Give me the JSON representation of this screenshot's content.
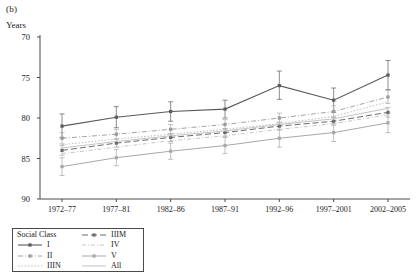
{
  "panel": {
    "label": "(b)"
  },
  "axes": {
    "y_title": "Years",
    "y_ticks": [
      "90",
      "85",
      "80",
      "75",
      "70"
    ],
    "x_ticks": [
      "1972–77",
      "1977–81",
      "1982–86",
      "1987–91",
      "1992–96",
      "1997–2001",
      "2002–2005"
    ]
  },
  "legend": {
    "title": "Social Class",
    "entries": [
      {
        "label": "I",
        "style": "solid-marker",
        "color": "#5a5a5a"
      },
      {
        "label": "II",
        "style": "dash-dot",
        "color": "#9a9a9a"
      },
      {
        "label": "IIIN",
        "style": "dotted",
        "color": "#b5b5b5"
      },
      {
        "label": "IIIM",
        "style": "dashed",
        "color": "#6b6b6b"
      },
      {
        "label": "IV",
        "style": "dash-dot-fine",
        "color": "#c0c0c0"
      },
      {
        "label": "V",
        "style": "solid-marker-light",
        "color": "#a8a8a8"
      },
      {
        "label": "All",
        "style": "solid-light",
        "color": "#bcbcbc"
      }
    ]
  },
  "chart_data": {
    "type": "line",
    "title": "",
    "xlabel": "",
    "ylabel": "Years",
    "ylim": [
      70,
      90
    ],
    "y_ticks": [
      70,
      75,
      80,
      85,
      90
    ],
    "grid": false,
    "legend_position": "below-left",
    "error_bars": true,
    "categories": [
      "1972–77",
      "1977–81",
      "1982–86",
      "1987–91",
      "1992–96",
      "1997–2001",
      "2002–2005"
    ],
    "series": [
      {
        "name": "I",
        "color": "#5a5a5a",
        "style": "solid-marker",
        "values": [
          79.0,
          80.1,
          80.8,
          81.1,
          84.0,
          82.2,
          85.3
        ],
        "err_low": [
          77.6,
          78.8,
          79.6,
          80.0,
          82.3,
          80.7,
          83.5
        ],
        "err_high": [
          80.5,
          81.4,
          82.0,
          82.2,
          85.8,
          83.7,
          87.1
        ]
      },
      {
        "name": "II",
        "color": "#9a9a9a",
        "style": "dash-dot",
        "values": [
          77.5,
          78.0,
          78.6,
          79.2,
          80.0,
          80.8,
          82.6
        ],
        "err_low": [
          76.8,
          77.4,
          78.0,
          78.6,
          79.4,
          80.1,
          81.8
        ],
        "err_high": [
          78.2,
          78.6,
          79.2,
          79.8,
          80.6,
          81.5,
          83.4
        ]
      },
      {
        "name": "IIIN",
        "color": "#b5b5b5",
        "style": "dotted",
        "values": [
          76.7,
          77.4,
          78.0,
          78.6,
          79.3,
          80.2,
          82.0
        ],
        "err_low": [
          75.9,
          76.7,
          77.3,
          77.9,
          78.6,
          79.4,
          81.1
        ],
        "err_high": [
          77.5,
          78.1,
          78.7,
          79.3,
          80.0,
          81.0,
          82.9
        ]
      },
      {
        "name": "IIIM",
        "color": "#6b6b6b",
        "style": "dashed",
        "values": [
          76.0,
          76.9,
          77.6,
          78.2,
          79.0,
          79.6,
          80.7
        ],
        "err_low": [
          75.4,
          76.4,
          77.1,
          77.7,
          78.5,
          79.1,
          80.1
        ],
        "err_high": [
          76.6,
          77.4,
          78.1,
          78.7,
          79.5,
          80.1,
          81.3
        ]
      },
      {
        "name": "IV",
        "color": "#c0c0c0",
        "style": "dash-dot-fine",
        "values": [
          75.6,
          76.4,
          77.2,
          77.8,
          78.6,
          79.3,
          80.4
        ],
        "err_low": [
          74.9,
          75.8,
          76.6,
          77.2,
          78.0,
          78.7,
          79.7
        ],
        "err_high": [
          76.3,
          77.0,
          77.8,
          78.4,
          79.2,
          79.9,
          81.1
        ]
      },
      {
        "name": "V",
        "color": "#a8a8a8",
        "style": "solid-marker-light",
        "values": [
          74.0,
          75.1,
          75.9,
          76.6,
          77.5,
          78.2,
          79.4
        ],
        "err_low": [
          72.9,
          74.1,
          74.9,
          75.6,
          76.4,
          77.1,
          78.2
        ],
        "err_high": [
          75.1,
          76.1,
          76.9,
          77.6,
          78.6,
          79.3,
          80.6
        ]
      },
      {
        "name": "All",
        "color": "#bcbcbc",
        "style": "solid-light",
        "values": [
          76.3,
          77.1,
          77.8,
          78.4,
          79.2,
          79.9,
          81.2
        ],
        "err_low": [
          76.3,
          77.1,
          77.8,
          78.4,
          79.2,
          79.9,
          81.2
        ],
        "err_high": [
          76.3,
          77.1,
          77.8,
          78.4,
          79.2,
          79.9,
          81.2
        ]
      }
    ]
  }
}
